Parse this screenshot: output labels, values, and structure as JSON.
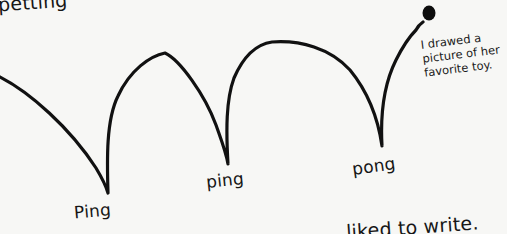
{
  "illustration": {
    "description": "Hand-drawn bouncing ball trajectory",
    "stroke_color": "#111111",
    "background_color": "#f7f7f5",
    "ball_color": "#0d0d0d"
  },
  "text": {
    "top_cropped": "petting",
    "bounce_labels": [
      "Ping",
      "ping",
      "pong"
    ],
    "note_lines": [
      "I drawed a",
      "picture of her",
      "favorite toy."
    ],
    "bottom_cropped": "liked to write."
  }
}
